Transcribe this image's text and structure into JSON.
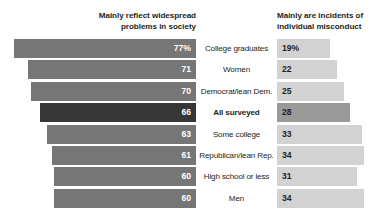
{
  "headers": {
    "left": "Mainly reflect widespread problems in society",
    "right": "Mainly are incidents of individual misconduct"
  },
  "chart_data": {
    "type": "bar",
    "title": "",
    "subtitle": "",
    "orientation": "horizontal",
    "layout": "diverging-paired",
    "grid": false,
    "legend_position": "top",
    "xlabel": "",
    "ylabel": "",
    "xlim": [
      0,
      100
    ],
    "categories": [
      "College graduates",
      "Women",
      "Democrat/lean Dem.",
      "All surveyed",
      "Some college",
      "Republican/lean Rep.",
      "High school or less",
      "Men"
    ],
    "series": [
      {
        "name": "Mainly reflect widespread problems in society",
        "values": [
          77,
          71,
          70,
          66,
          63,
          61,
          60,
          60
        ],
        "labels": [
          "77%",
          "71",
          "70",
          "66",
          "63",
          "61",
          "60",
          "60"
        ],
        "color": "#767676",
        "highlight_color": "#363636"
      },
      {
        "name": "Mainly are incidents of individual misconduct",
        "values": [
          19,
          22,
          25,
          28,
          33,
          34,
          31,
          34
        ],
        "labels": [
          "19%",
          "22",
          "25",
          "28",
          "33",
          "34",
          "31",
          "34"
        ],
        "color": "#d2d2d2",
        "highlight_color": "#9a9a9a"
      }
    ],
    "highlight_category": "All surveyed"
  },
  "rows": [
    {
      "category": "College graduates",
      "left_value": 77,
      "left_label": "77%",
      "right_value": 19,
      "right_label": "19%",
      "highlight": false
    },
    {
      "category": "Women",
      "left_value": 71,
      "left_label": "71",
      "right_value": 22,
      "right_label": "22",
      "highlight": false
    },
    {
      "category": "Democrat/lean Dem.",
      "left_value": 70,
      "left_label": "70",
      "right_value": 25,
      "right_label": "25",
      "highlight": false
    },
    {
      "category": "All surveyed",
      "left_value": 66,
      "left_label": "66",
      "right_value": 28,
      "right_label": "28",
      "highlight": true
    },
    {
      "category": "Some college",
      "left_value": 63,
      "left_label": "63",
      "right_value": 33,
      "right_label": "33",
      "highlight": false
    },
    {
      "category": "Republican/lean Rep.",
      "left_value": 61,
      "left_label": "61",
      "right_value": 34,
      "right_label": "34",
      "highlight": false
    },
    {
      "category": "High school or less",
      "left_value": 60,
      "left_label": "60",
      "right_value": 31,
      "right_label": "31",
      "highlight": false
    },
    {
      "category": "Men",
      "left_value": 60,
      "left_label": "60",
      "right_value": 34,
      "right_label": "34",
      "highlight": false
    }
  ],
  "colors": {
    "bar_left": "#767676",
    "bar_left_highlight": "#363636",
    "bar_right": "#d2d2d2",
    "bar_right_highlight": "#9a9a9a",
    "text": "#231f20",
    "value_on_dark": "#ffffff",
    "background": "#ffffff"
  }
}
